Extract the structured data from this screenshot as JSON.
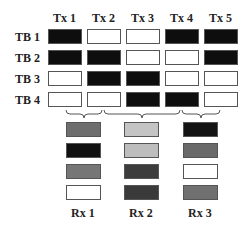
{
  "tx_labels": [
    "Tx 1",
    "Tx 2",
    "Tx 3",
    "Tx 4",
    "Tx 5"
  ],
  "tb_labels": [
    "TB 1",
    "TB 2",
    "TB 3",
    "TB 4"
  ],
  "rx_labels": [
    "Rx 1",
    "Rx 2",
    "Rx 3"
  ],
  "grid": [
    [
      "black",
      "white",
      "white",
      "black",
      "black"
    ],
    [
      "black",
      "black",
      "white",
      "white",
      "black"
    ],
    [
      "white",
      "black",
      "black",
      "white",
      "white"
    ],
    [
      "white",
      "white",
      "black",
      "black",
      "white"
    ]
  ],
  "rx_groups": [
    {
      "label": "Rx 1",
      "tx": [
        "Tx 1",
        "Tx 2"
      ],
      "cells": [
        "#6e6e6e",
        "#111111",
        "#767676",
        "#ffffff"
      ]
    },
    {
      "label": "Rx 2",
      "tx": [
        "Tx 2",
        "Tx 3",
        "Tx 4"
      ],
      "cells": [
        "#c4c4c4",
        "#bdbdbd",
        "#3c3c3c",
        "#3a3a3a"
      ]
    },
    {
      "label": "Rx 3",
      "tx": [
        "Tx 4",
        "Tx 5"
      ],
      "cells": [
        "#141414",
        "#6a6a6a",
        "#ffffff",
        "#707070"
      ]
    }
  ],
  "colors": {
    "black": "#0e0e0e",
    "white": "#ffffff"
  }
}
